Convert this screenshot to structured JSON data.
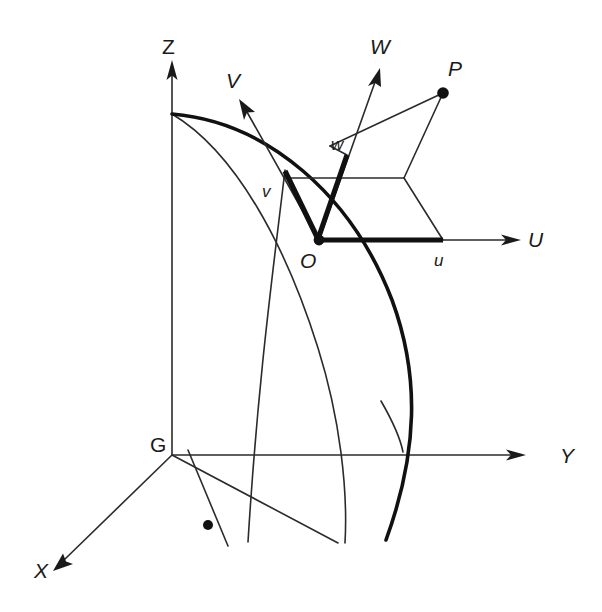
{
  "figure": {
    "background_color": "#ffffff",
    "stroke_color": "#1a1a1a"
  },
  "global_axes": {
    "origin_label": "G",
    "items": [
      {
        "name": "x-axis",
        "label": "X",
        "label_x": 38,
        "label_y": 578,
        "from_x": 172,
        "from_y": 455,
        "to_x": 58,
        "to_y": 566,
        "arrow": true
      },
      {
        "name": "y-axis",
        "label": "Y",
        "label_x": 560,
        "label_y": 456,
        "from_x": 172,
        "from_y": 455,
        "to_x": 524,
        "to_y": 455,
        "arrow": true
      },
      {
        "name": "z-axis",
        "label": "Z",
        "label_x": 162,
        "label_y": 54,
        "from_x": 172,
        "from_y": 455,
        "to_x": 172,
        "to_y": 62,
        "arrow": true
      }
    ],
    "origin_label_x": 152,
    "origin_label_y": 452
  },
  "local_axes": {
    "items": [
      {
        "name": "u-axis",
        "label": "U",
        "label_x": 532,
        "label_y": 247,
        "from_x": 319,
        "from_y": 240,
        "to_x": 518,
        "to_y": 240,
        "arrow": true
      },
      {
        "name": "v-axis",
        "label": "V",
        "label_x": 226,
        "label_y": 87,
        "from_x": 319,
        "from_y": 240,
        "to_x": 241,
        "to_y": 101,
        "arrow": true
      },
      {
        "name": "w-axis",
        "label": "W",
        "label_x": 372,
        "label_y": 54,
        "from_x": 319,
        "from_y": 240,
        "to_x": 380,
        "to_y": 69,
        "arrow": true
      }
    ]
  },
  "points": [
    {
      "name": "point-o",
      "label": "O",
      "x": 319,
      "y": 240,
      "label_x": 302,
      "label_y": 266,
      "radius": 5.4
    },
    {
      "name": "point-p",
      "label": "P",
      "x": 443,
      "y": 93,
      "label_x": 450,
      "label_y": 76,
      "radius": 5.8
    },
    {
      "name": "point-surface-marker",
      "label": "",
      "x": 208,
      "y": 525,
      "label_x": 0,
      "label_y": 0,
      "radius": 5.0
    }
  ],
  "components": [
    {
      "name": "component-u",
      "label": "u",
      "label_x": 436,
      "label_y": 264,
      "from_x": 319,
      "from_y": 240,
      "to_x": 443,
      "to_y": 240
    },
    {
      "name": "component-v",
      "label": "v",
      "label_x": 264,
      "label_y": 196,
      "from_x": 319,
      "from_y": 240,
      "to_x": 285,
      "to_y": 171
    },
    {
      "name": "component-w",
      "label": "w",
      "label_x": 333,
      "label_y": 149,
      "from_x": 319,
      "from_y": 240,
      "to_x": 347,
      "to_y": 155
    }
  ],
  "parallelepiped": {
    "name": "uvw-parallelepiped",
    "edges": [
      {
        "name": "edge-top-horizontal",
        "d": "M 285 178 L 404 178"
      },
      {
        "name": "edge-v-right",
        "d": "M 404 178 L 443 240"
      },
      {
        "name": "edge-o-to-p",
        "d": "M 330 146 L 443 93"
      },
      {
        "name": "edge-w-to-p",
        "d": "M 443 93 L 404 178"
      },
      {
        "name": "edge-w-riser",
        "d": "M 347 155 L 330 146"
      }
    ]
  },
  "curves": [
    {
      "name": "surface-outline-thick",
      "d": "M 172 114 C 268 122 352 196 392 300 C 420 376 418 452 386 540",
      "weight": "thick"
    },
    {
      "name": "surface-generator-thin-left",
      "d": "M 172 114 C 236 152 286 246 318 348 C 340 418 348 490 345 543",
      "weight": "thin"
    },
    {
      "name": "surface-generator-thin-right",
      "d": "M 285 170 C 274 264 258 378 248 542",
      "weight": "thin"
    },
    {
      "name": "surface-tick-curve",
      "d": "M 381 401 C 392 420 400 437 403 452",
      "weight": "thin"
    },
    {
      "name": "base-edge-g-to-surface",
      "d": "M 172 455 L 338 543",
      "weight": "thin"
    },
    {
      "name": "normal-line-at-marker",
      "d": "M 188 450 L 228 546",
      "weight": "thin"
    }
  ],
  "labels": {
    "axis_font_size": 21,
    "component_font_size": 17
  }
}
